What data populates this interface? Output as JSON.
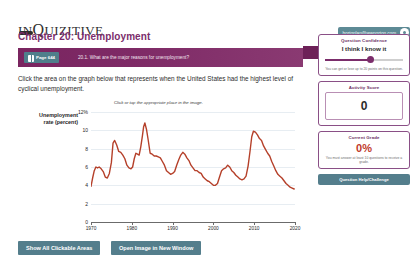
{
  "header": {
    "logo_text_1": "IN",
    "logo_text_2": "Q",
    "logo_text_3": "UIZITIVE",
    "logo_icon": "dash-mark",
    "account_email": "hortonlan@wwnorton.com",
    "settings_icon": "gear-icon"
  },
  "chapter": {
    "title": "Chapter 20: Unemployment"
  },
  "question_bar": {
    "page_badge": "Page 644",
    "book_icon": "book-icon",
    "question_text": "20.1. What are the major reasons for unemployment?"
  },
  "instruction": "Click the area on the graph below that represents when the United States had the highest level of cyclical unemployment.",
  "chart_data": {
    "type": "line",
    "title": "",
    "caption": "Click or tap the appropriate place in the image.",
    "xlabel": "",
    "ylabel": "Unemployment rate (percent)",
    "ylabel_line1": "Unemployment",
    "ylabel_line2": "rate (percent)",
    "yticks": [
      "12%",
      "10",
      "8",
      "6",
      "4",
      "2",
      "0"
    ],
    "ytick_values": [
      12,
      10,
      8,
      6,
      4,
      2,
      0
    ],
    "ylim": [
      0,
      12
    ],
    "xticks": [
      "1970",
      "1980",
      "1990",
      "2000",
      "2010",
      "2020"
    ],
    "xtick_values": [
      1970,
      1980,
      1990,
      2000,
      2010,
      2020
    ],
    "xlim": [
      1970,
      2020
    ],
    "grid": true,
    "legend": "none",
    "line_color": "#b5402a",
    "series": [
      {
        "name": "Unemployment rate",
        "x": [
          1970.0,
          1970.4,
          1970.8,
          1971.2,
          1971.6,
          1972.0,
          1972.5,
          1973.0,
          1973.5,
          1974.0,
          1974.5,
          1975.0,
          1975.4,
          1975.8,
          1976.3,
          1976.8,
          1977.3,
          1977.8,
          1978.3,
          1978.8,
          1979.3,
          1979.8,
          1980.2,
          1980.6,
          1981.0,
          1981.4,
          1981.8,
          1982.2,
          1982.6,
          1982.9,
          1983.2,
          1983.6,
          1984.0,
          1984.5,
          1985.0,
          1985.5,
          1986.0,
          1986.5,
          1987.0,
          1987.5,
          1988.0,
          1988.5,
          1989.0,
          1989.5,
          1990.0,
          1990.5,
          1991.0,
          1991.5,
          1992.0,
          1992.5,
          1993.0,
          1993.5,
          1994.0,
          1994.5,
          1995.0,
          1995.5,
          1996.0,
          1996.5,
          1997.0,
          1997.5,
          1998.0,
          1998.5,
          1999.0,
          1999.5,
          2000.0,
          2000.5,
          2001.0,
          2001.5,
          2002.0,
          2002.5,
          2003.0,
          2003.5,
          2004.0,
          2004.5,
          2005.0,
          2005.5,
          2006.0,
          2006.5,
          2007.0,
          2007.5,
          2008.0,
          2008.5,
          2009.0,
          2009.4,
          2009.8,
          2010.3,
          2010.8,
          2011.3,
          2011.8,
          2012.3,
          2012.8,
          2013.3,
          2013.8,
          2014.3,
          2014.8,
          2015.3,
          2015.8,
          2016.3,
          2016.8,
          2017.3,
          2017.8,
          2018.3,
          2018.8,
          2019.3,
          2019.8
        ],
        "y": [
          3.9,
          4.8,
          5.6,
          6.0,
          5.9,
          6.0,
          5.8,
          5.5,
          4.9,
          4.8,
          5.3,
          6.5,
          8.6,
          8.9,
          8.4,
          7.7,
          7.6,
          7.3,
          6.9,
          6.2,
          5.9,
          5.8,
          6.0,
          6.9,
          7.5,
          7.4,
          7.3,
          8.2,
          9.4,
          10.4,
          10.8,
          10.1,
          9.0,
          7.5,
          7.4,
          7.2,
          7.2,
          7.1,
          7.0,
          6.6,
          6.2,
          5.6,
          5.4,
          5.2,
          5.3,
          5.5,
          6.2,
          6.8,
          7.3,
          7.6,
          7.4,
          7.0,
          6.7,
          6.2,
          5.9,
          5.6,
          5.6,
          5.4,
          5.3,
          4.9,
          4.7,
          4.5,
          4.4,
          4.2,
          4.0,
          4.0,
          4.2,
          4.9,
          5.6,
          5.8,
          5.9,
          6.2,
          6.0,
          5.6,
          5.4,
          5.1,
          4.9,
          4.7,
          4.6,
          4.7,
          5.0,
          6.1,
          7.8,
          9.3,
          9.9,
          9.8,
          9.5,
          9.1,
          8.9,
          8.3,
          7.9,
          7.5,
          7.2,
          6.6,
          6.1,
          5.6,
          5.2,
          5.0,
          4.8,
          4.5,
          4.2,
          4.0,
          3.8,
          3.7,
          3.6
        ]
      }
    ]
  },
  "actions": {
    "show_areas": "Show All Clickable Areas",
    "open_image": "Open Image in New Window"
  },
  "sidebar": {
    "confidence": {
      "title": "Question Confidence",
      "value": "I think I know it",
      "note": "You can get or lose up to 20 points on this question."
    },
    "activity": {
      "title": "Activity Score",
      "value": "0"
    },
    "grade": {
      "title": "Current Grade",
      "value": "0%",
      "note": "You must answer at least 10 questions to receive a grade."
    },
    "help_button": "Question Help/Challenge"
  }
}
